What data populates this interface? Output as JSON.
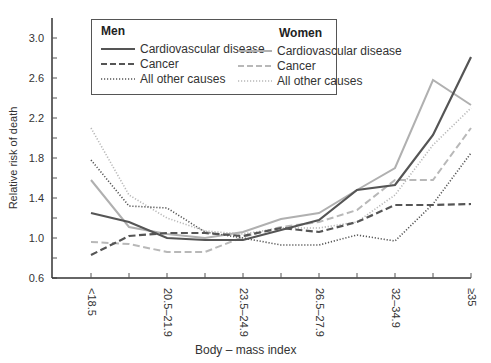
{
  "chart_data": {
    "type": "line",
    "title": "",
    "xlabel": "Body – mass index",
    "ylabel": "Relative risk of death",
    "ylim": [
      0.6,
      3.1
    ],
    "yticks": [
      0.6,
      1.0,
      1.4,
      1.8,
      2.2,
      2.6,
      3.0
    ],
    "ytick_labels": [
      "0.6",
      "1.0",
      "1.4",
      "1.8",
      "2.2",
      "2.6",
      "3.0"
    ],
    "grid": false,
    "legend_position": "top-left inside",
    "x_tick_count": 11,
    "x_labeled_ticks": [
      {
        "index": 0,
        "label": "<18.5"
      },
      {
        "index": 2,
        "label": "20.5–21.9"
      },
      {
        "index": 4,
        "label": "23.5–24.9"
      },
      {
        "index": 6,
        "label": "26.5–27.9"
      },
      {
        "index": 8,
        "label": "32–34.9"
      },
      {
        "index": 10,
        "label": "≥35"
      }
    ],
    "categories": [
      "<18.5",
      "18.5–20.4",
      "20.5–21.9",
      "22.0–23.4",
      "23.5–24.9",
      "25.0–26.4",
      "26.5–27.9",
      "28.0–29.9",
      "30.0–31.9",
      "32–34.9",
      "≥35"
    ],
    "series": [
      {
        "name": "Men – Cardiovascular disease",
        "group": "Men",
        "label": "Cardiovascular disease",
        "color": "#555555",
        "dash": "solid",
        "width": 2.2,
        "values": [
          1.25,
          1.16,
          1.0,
          0.98,
          0.98,
          1.08,
          1.18,
          1.48,
          1.53,
          2.03,
          2.81
        ]
      },
      {
        "name": "Men – Cancer",
        "group": "Men",
        "label": "Cancer",
        "color": "#555555",
        "dash": "dashed",
        "width": 2.2,
        "values": [
          0.83,
          1.02,
          1.05,
          1.05,
          1.02,
          1.1,
          1.06,
          1.16,
          1.33,
          1.33,
          1.34
        ]
      },
      {
        "name": "Men – All other causes",
        "group": "Men",
        "label": "All other causes",
        "color": "#555555",
        "dash": "dotted",
        "width": 1.6,
        "values": [
          1.78,
          1.32,
          1.3,
          1.06,
          1.0,
          0.93,
          0.93,
          1.03,
          0.97,
          1.34,
          1.85
        ]
      },
      {
        "name": "Women – Cardiovascular disease",
        "group": "Women",
        "label": "Cardiovascular disease",
        "color": "#b0b0b0",
        "dash": "solid",
        "width": 2.0,
        "values": [
          1.58,
          1.11,
          1.04,
          1.0,
          1.06,
          1.19,
          1.25,
          1.48,
          1.7,
          2.58,
          2.33
        ]
      },
      {
        "name": "Women – Cancer",
        "group": "Women",
        "label": "Cancer",
        "color": "#b8b8b8",
        "dash": "dashed",
        "width": 2.0,
        "values": [
          0.96,
          0.94,
          0.86,
          0.86,
          1.01,
          1.11,
          1.16,
          1.28,
          1.58,
          1.58,
          2.1
        ]
      },
      {
        "name": "Women – All other causes",
        "group": "Women",
        "label": "All other causes",
        "color": "#b8b8b8",
        "dash": "dotted",
        "width": 1.6,
        "values": [
          2.1,
          1.43,
          1.2,
          1.07,
          1.04,
          1.1,
          1.1,
          1.16,
          1.43,
          1.93,
          2.3
        ]
      }
    ]
  },
  "legend": {
    "men": {
      "title": "Men",
      "items": [
        {
          "label": "Cardiovascular disease",
          "dash": "solid",
          "color": "#555555"
        },
        {
          "label": "Cancer",
          "dash": "dashed",
          "color": "#555555"
        },
        {
          "label": "All other causes",
          "dash": "dotted",
          "color": "#555555"
        }
      ]
    },
    "women": {
      "title": "Women",
      "items": [
        {
          "label": "Cardiovascular disease",
          "dash": "solid",
          "color": "#b0b0b0"
        },
        {
          "label": "Cancer",
          "dash": "dashed",
          "color": "#b8b8b8"
        },
        {
          "label": "All other causes",
          "dash": "dotted",
          "color": "#b8b8b8"
        }
      ]
    }
  },
  "axes": {
    "y_title": "Relative risk of death",
    "x_title": "Body – mass index"
  }
}
